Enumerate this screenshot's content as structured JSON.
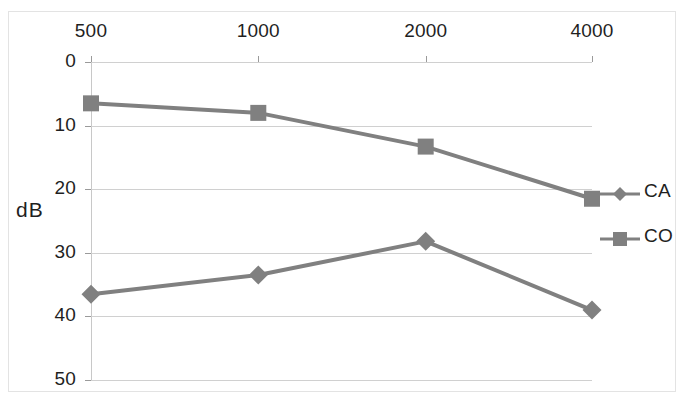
{
  "chart_data": {
    "type": "line",
    "title": "",
    "subtitle": "",
    "xlabel": "",
    "ylabel": "dB",
    "x": [
      500,
      1000,
      2000,
      4000
    ],
    "categories": [
      "500",
      "1000",
      "2000",
      "4000"
    ],
    "xtick_labels": [
      "500",
      "1000",
      "2000",
      "4000"
    ],
    "ytick_labels": [
      "0",
      "10",
      "20",
      "30",
      "40",
      "50"
    ],
    "yticks": [
      0,
      10,
      20,
      30,
      40,
      50
    ],
    "ylim": [
      0,
      50
    ],
    "y_axis_inverted": true,
    "x_axis_position": "top",
    "grid": true,
    "legend_position": "right",
    "series": [
      {
        "name": "CA",
        "marker": "diamond",
        "color": "#808080",
        "values": [
          36.5,
          33.5,
          28.2,
          39.0
        ]
      },
      {
        "name": "CO",
        "marker": "square",
        "color": "#808080",
        "values": [
          6.5,
          8.0,
          13.3,
          21.5
        ]
      }
    ]
  },
  "axes": {
    "y_title": "dB",
    "y_ticks": [
      "0",
      "10",
      "20",
      "30",
      "40",
      "50"
    ],
    "x_ticks": [
      "500",
      "1000",
      "2000",
      "4000"
    ]
  },
  "legend": {
    "items": [
      {
        "label": "CA",
        "marker": "diamond-marker-icon"
      },
      {
        "label": "CO",
        "marker": "square-marker-icon"
      }
    ]
  },
  "colors": {
    "series": "#808080",
    "gridline": "#d0d0d0",
    "axis": "#9a9a9a",
    "frame": "#e3e3e3",
    "text": "#1f1f1f"
  }
}
